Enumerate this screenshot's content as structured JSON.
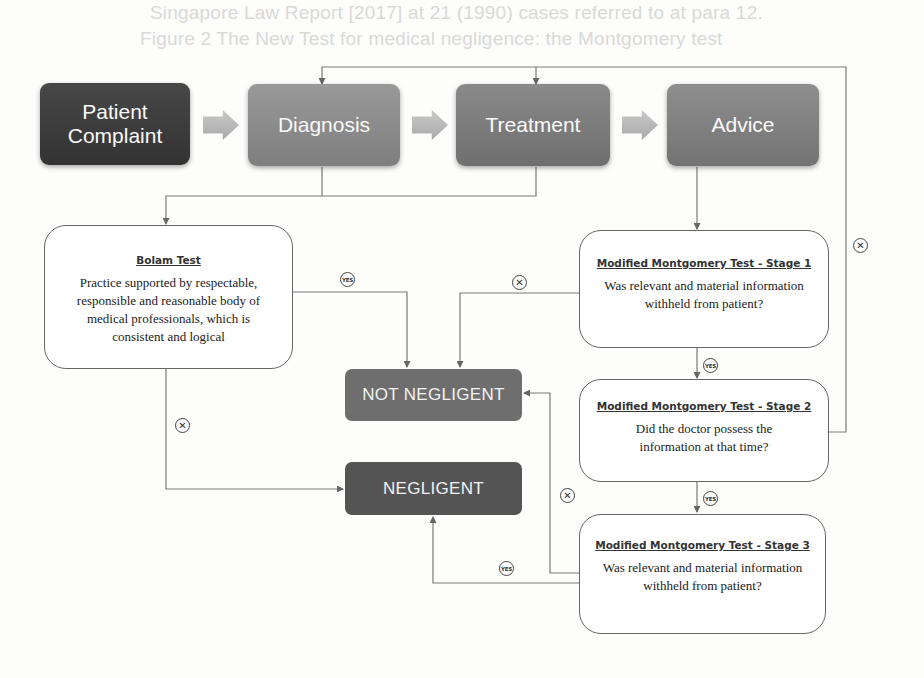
{
  "background_bleed": [
    "Singapore Law Report [2017] at 21 (1990) cases referred to at para 12.",
    "Figure 2 The New Test for medical negligence: the Montgomery test",
    "and [2017] SGCA 11 at [1].",
    "3 The [ ] would not be [ ] and after the [ ] of the law of",
    "Med Singapore 2017; 58(9): 350."
  ],
  "flow": {
    "stages": [
      {
        "id": "patient-complaint",
        "label": "Patient Complaint",
        "color": "#3f3f3f"
      },
      {
        "id": "diagnosis",
        "label": "Diagnosis",
        "color": "#8b8b8b"
      },
      {
        "id": "treatment",
        "label": "Treatment",
        "color": "#7a7a7a"
      },
      {
        "id": "advice",
        "label": "Advice",
        "color": "#7e7e7e"
      }
    ]
  },
  "tests": {
    "bolam": {
      "title": "Bolam Test",
      "body": "Practice supported by respectable, responsible and reasonable body of medical professionals, which is consistent and logical"
    },
    "montgomery_1": {
      "title": "Modified Montgomery Test - Stage 1",
      "body": "Was relevant and material information withheld from patient?"
    },
    "montgomery_2": {
      "title": "Modified Montgomery Test - Stage 2",
      "body": "Did the doctor possess the information at that time?"
    },
    "montgomery_3": {
      "title": "Modified Montgomery Test - Stage 3",
      "body": "Was relevant and material information withheld from patient?"
    }
  },
  "outcomes": {
    "not_negligent": {
      "label": "NOT NEGLIGENT",
      "color": "#6e6e6e"
    },
    "negligent": {
      "label": "NEGLIGENT",
      "color": "#545454"
    }
  },
  "badges": {
    "yes": "YES",
    "no": "✕"
  },
  "colors": {
    "line": "#777777",
    "box_border": "#666666"
  }
}
